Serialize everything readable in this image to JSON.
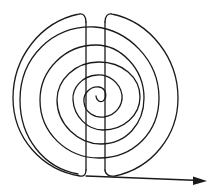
{
  "diagram": {
    "stroke_color": "#1a1a1a",
    "background": "#ffffff",
    "elements": [
      {
        "type": "spiral",
        "center": [
          98,
          98
        ],
        "turns": 5
      },
      {
        "type": "vertical-line",
        "x": 86,
        "y_range": [
          12,
          176
        ]
      },
      {
        "type": "vertical-line",
        "x": 105,
        "y_range": [
          12,
          176
        ]
      },
      {
        "type": "arrow",
        "from": [
          86,
          176
        ],
        "to": [
          207,
          181
        ]
      }
    ]
  }
}
